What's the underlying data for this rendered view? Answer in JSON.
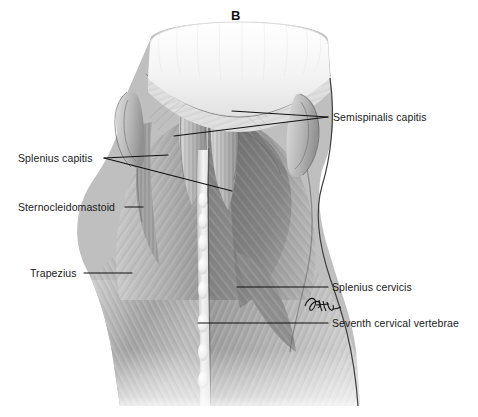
{
  "figure": {
    "panel_label": "B",
    "panel_label_pos": {
      "x": 231,
      "y": 8
    },
    "width": 478,
    "height": 417,
    "background_color": "#ffffff",
    "ink_color": "#1a1a1a"
  },
  "signature": {
    "name": "artist-signature",
    "text": "",
    "pos": {
      "x": 305,
      "y": 298
    }
  },
  "annotations": [
    {
      "id": "semispinalis-capitis",
      "label": "Semispinalis capitis",
      "side": "right",
      "text_pos": {
        "x": 333,
        "y": 111
      },
      "leaders": [
        {
          "x1": 328,
          "y1": 117,
          "x2": 232,
          "y2": 111
        },
        {
          "x1": 328,
          "y1": 117,
          "x2": 174,
          "y2": 136
        }
      ]
    },
    {
      "id": "splenius-capitis",
      "label": "Splenius capitis",
      "side": "left",
      "text_pos": {
        "x": 18,
        "y": 152
      },
      "leaders": [
        {
          "x1": 104,
          "y1": 158,
          "x2": 168,
          "y2": 155
        },
        {
          "x1": 104,
          "y1": 158,
          "x2": 232,
          "y2": 191
        }
      ]
    },
    {
      "id": "sternocleidomastoid",
      "label": "Sternocleidomastoid",
      "side": "left",
      "text_pos": {
        "x": 18,
        "y": 201
      },
      "leaders": [
        {
          "x1": 125,
          "y1": 207,
          "x2": 143,
          "y2": 207
        }
      ]
    },
    {
      "id": "trapezius",
      "label": "Trapezius",
      "side": "left",
      "text_pos": {
        "x": 30,
        "y": 267
      },
      "leaders": [
        {
          "x1": 84,
          "y1": 273,
          "x2": 132,
          "y2": 273
        }
      ]
    },
    {
      "id": "splenius-cervicis",
      "label": "Splenius cervicis",
      "side": "right",
      "text_pos": {
        "x": 332,
        "y": 281
      },
      "leaders": [
        {
          "x1": 328,
          "y1": 287,
          "x2": 237,
          "y2": 287
        }
      ]
    },
    {
      "id": "seventh-cervical-vertebrae",
      "label": "Seventh cervical vertebrae",
      "side": "right",
      "text_pos": {
        "x": 332,
        "y": 317
      },
      "leaders": [
        {
          "x1": 328,
          "y1": 323,
          "x2": 198,
          "y2": 323
        }
      ]
    }
  ],
  "colors": {
    "scalp": "#f2f2f2",
    "muscle_light": "#d7d7d7",
    "muscle_mid": "#a8a8a8",
    "muscle_dark": "#7b7b7b",
    "muscle_deep": "#5e5e5e",
    "outline": "#3a3a3a",
    "vertebra": "#ededed",
    "label_text": "#1a1a1a"
  }
}
